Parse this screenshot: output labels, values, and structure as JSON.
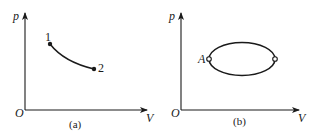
{
  "panel_a": {
    "caption": "(a)",
    "y_axis_label": "p",
    "x_axis_label": "V",
    "origin_label": "O",
    "points": [
      {
        "label": "1",
        "x": 50,
        "y": 44
      },
      {
        "label": "2",
        "x": 94,
        "y": 69
      }
    ],
    "process": "curve from state 1 to state 2 (decreasing p, increasing V)"
  },
  "panel_b": {
    "caption": "(b)",
    "y_axis_label": "p",
    "x_axis_label": "V",
    "origin_label": "O",
    "cycle": "closed elliptical cycle",
    "point_label": "A"
  },
  "colors": {
    "line": "#1a1a1a",
    "background": "#ffffff"
  }
}
